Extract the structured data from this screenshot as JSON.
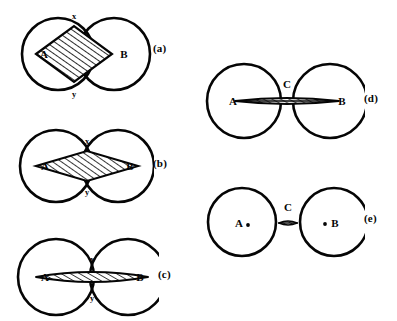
{
  "figure": {
    "background": "#ffffff",
    "ink": "#050505",
    "panels": [
      {
        "id": "a",
        "tag": "(a)",
        "left_circle_label": "A",
        "right_circle_label": "B",
        "top_point_label": "x",
        "bottom_point_label": "y",
        "bridge_label": "",
        "description": "two strongly overlapping circles with a wide hatched rhombus joining centre A to centre B through intersection points x and y",
        "overlap": "wide",
        "hatch_region": "rhombus",
        "circle_radius": 36,
        "center_separation": 56,
        "lens_half_height": 25
      },
      {
        "id": "b",
        "tag": "(b)",
        "left_circle_label": "A",
        "right_circle_label": "B",
        "top_point_label": "x",
        "bottom_point_label": "y",
        "bridge_label": "",
        "description": "two overlapping circles with a flatter hatched rhombus joining centre A to centre B through intersection points x and y",
        "overlap": "medium",
        "hatch_region": "rhombus",
        "circle_radius": 36,
        "center_separation": 62,
        "lens_half_height": 15
      },
      {
        "id": "c",
        "tag": "(c)",
        "left_circle_label": "A",
        "right_circle_label": "B",
        "top_point_label": "x",
        "bottom_point_label": "y",
        "bridge_label": "",
        "description": "two barely overlapping circles with a thin hatched spindle joining centre A to centre B through intersection points x and y",
        "overlap": "slight",
        "hatch_region": "spindle",
        "circle_radius": 38,
        "center_separation": 72,
        "lens_half_height": 8
      },
      {
        "id": "d",
        "tag": "(d)",
        "left_circle_label": "A",
        "right_circle_label": "B",
        "top_point_label": "",
        "bottom_point_label": "",
        "bridge_label": "C",
        "description": "two tangent circles joined by a long thin hatched bridge labelled C running from centre A to centre B",
        "overlap": "tangent",
        "hatch_region": "bridge",
        "circle_radius": 37,
        "center_separation": 86,
        "lens_half_height": 5
      },
      {
        "id": "e",
        "tag": "(e)",
        "left_circle_label": "A",
        "right_circle_label": "B",
        "top_point_label": "",
        "bottom_point_label": "",
        "bridge_label": "C",
        "description": "two separated circles with centre dots and a very small hatched connector labelled C between them",
        "overlap": "separated",
        "hatch_region": "connector",
        "circle_radius": 34,
        "center_separation": 92,
        "lens_half_height": 3
      }
    ]
  }
}
